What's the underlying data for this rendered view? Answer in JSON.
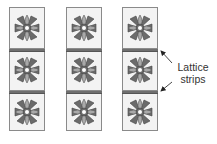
{
  "diagram": {
    "type": "quilt-assembly",
    "columns": [
      {
        "id": "col-1",
        "x": 9,
        "blocks": 3
      },
      {
        "id": "col-2",
        "x": 66,
        "blocks": 3
      },
      {
        "id": "col-3",
        "x": 122,
        "blocks": 3
      }
    ],
    "lattice_strips_per_column": 2,
    "annotation": {
      "line1": "Lattice",
      "line2": "strips",
      "points_to": [
        "lattice-strip-col3-1",
        "lattice-strip-col3-2"
      ]
    },
    "colors": {
      "block_bg": "#f3f3f3",
      "border": "#8a8a8a",
      "lattice": "#6f6f6f",
      "petal_dark": "#6b6b6b",
      "petal_light": "#a9a9a9",
      "center": "#ffffff"
    }
  }
}
